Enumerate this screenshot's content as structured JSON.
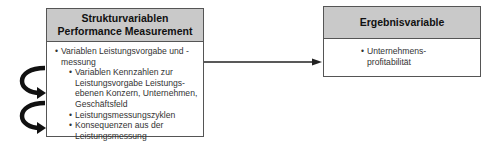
{
  "structure_box": {
    "title_line1": "Strukturvariablen",
    "title_line2": "Performance Measurement",
    "items": [
      {
        "level": 1,
        "text": "Variablen Leistungsvorgabe und -messung"
      },
      {
        "level": 2,
        "text": "Variablen Kennzahlen zur Leistungsvorgabe Leistungs-ebenen Konzern, Unternehmen, Geschäftsfeld"
      },
      {
        "level": 2,
        "text": "Leistungsmessungszyklen"
      },
      {
        "level": 2,
        "text": "Konsequenzen aus der Leistungsmessung"
      }
    ]
  },
  "result_box": {
    "title": "Ergebnisvariable",
    "items": [
      {
        "level": 1,
        "text": "Unternehmens-profitabilität"
      }
    ]
  },
  "colors": {
    "header_fill": "#c9c9c9",
    "border": "#555555",
    "arrow": "#222222"
  }
}
